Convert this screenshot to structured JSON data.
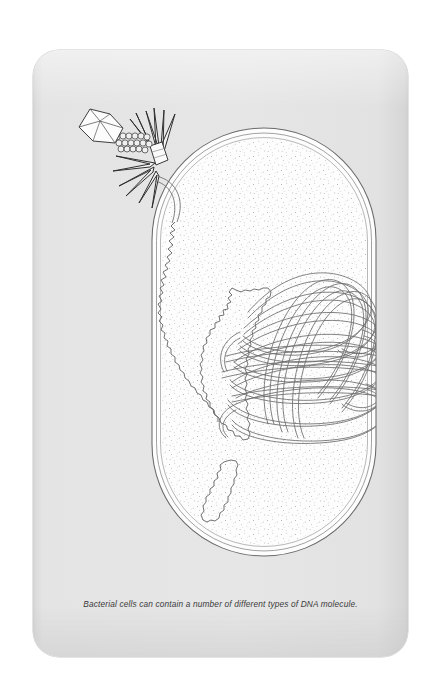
{
  "figure": {
    "caption": "Bacterial cells can contain a number of different types of DNA molecule.",
    "background_color": "#ffffff",
    "card_color": "#e5e5e5",
    "ink_color": "#555555",
    "cytoplasm_color": "#fdfdfd"
  },
  "diagram": {
    "type": "biological-schematic",
    "elements": [
      {
        "name": "bacteriophage",
        "label": "Bacteriophage (virus)",
        "description": "Icosahedral head, beaded contractile tail and radiating tail fibres attached to the outside of the cell wall."
      },
      {
        "name": "phage-head",
        "label": "Phage capsid head",
        "description": "Hexagonal prism outline drawn in three-quarter perspective."
      },
      {
        "name": "phage-tail",
        "label": "Phage tail sheath",
        "description": "Beaded cylindrical tail running from the head to the baseplate."
      },
      {
        "name": "phage-tail-fibres",
        "label": "Tail fibres",
        "description": "Spiky triangular fibres radiating from the baseplate onto the cell surface."
      },
      {
        "name": "cell-wall",
        "label": "Bacterial cell wall and membrane",
        "description": "Capsule-shaped triple outline enclosing the cytoplasm."
      },
      {
        "name": "cytoplasm",
        "label": "Cytoplasm",
        "description": "Stippled interior of the bacterial cell."
      },
      {
        "name": "phage-dna",
        "label": "Injected phage DNA",
        "description": "Long wavy strand entering through the cell wall at the phage attachment point."
      },
      {
        "name": "plasmid-large",
        "label": "Large plasmid",
        "description": "Irregular closed circular DNA loop drawn with a helical zig-zag line."
      },
      {
        "name": "plasmid-small",
        "label": "Small plasmid",
        "description": "Small elongated closed circular DNA loop near the base of the cell."
      },
      {
        "name": "nucleoid",
        "label": "Bacterial chromosome (nucleoid)",
        "description": "Large mass of supercoiled looped DNA occupying the right half of the cell."
      }
    ]
  }
}
